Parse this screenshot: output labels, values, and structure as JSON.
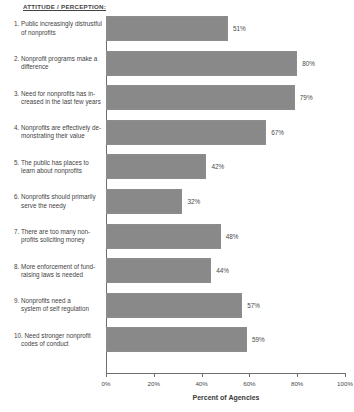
{
  "header": {
    "title": "ATTITUDE / PERCEPTION:"
  },
  "axis": {
    "x_title": "Percent of Agencies",
    "tick_labels": [
      "0%",
      "20%",
      "40%",
      "60%",
      "80%",
      "100%"
    ],
    "tick_values": [
      0,
      20,
      40,
      60,
      80,
      100
    ]
  },
  "categories": [
    {
      "number": "1.",
      "lines": [
        "1. Public increasingly distrustful",
        "of nonprofits"
      ],
      "value": 51,
      "value_label": "51%"
    },
    {
      "number": "2.",
      "lines": [
        "2. Nonprofit programs make a",
        "difference"
      ],
      "value": 80,
      "value_label": "80%"
    },
    {
      "number": "3.",
      "lines": [
        "3. Need for nonprofits has in-",
        "creased in the last few years"
      ],
      "value": 79,
      "value_label": "79%"
    },
    {
      "number": "4.",
      "lines": [
        "4. Nonprofits are effectively de-",
        "monstrating their  value"
      ],
      "value": 67,
      "value_label": "67%"
    },
    {
      "number": "5.",
      "lines": [
        "5. The public has places to",
        "learn about nonprofits"
      ],
      "value": 42,
      "value_label": "42%"
    },
    {
      "number": "6.",
      "lines": [
        "6. Nonprofits should primarily",
        "serve the needy"
      ],
      "value": 32,
      "value_label": "32%"
    },
    {
      "number": "7.",
      "lines": [
        "7. There are  too many non-",
        "profits soliciting money"
      ],
      "value": 48,
      "value_label": "48%"
    },
    {
      "number": "8.",
      "lines": [
        "8. More enforcement of fund-",
        "raising laws is needed"
      ],
      "value": 44,
      "value_label": "44%"
    },
    {
      "number": "9.",
      "lines": [
        "9. Nonprofits need a",
        "system of self regulation"
      ],
      "value": 57,
      "value_label": "57%"
    },
    {
      "number": "10.",
      "lines": [
        "10. Need stronger nonprofit",
        "codes of conduct"
      ],
      "value": 59,
      "value_label": "59%"
    }
  ],
  "chart_data": {
    "type": "bar",
    "orientation": "horizontal",
    "title": "ATTITUDE / PERCEPTION:",
    "xlabel": "Percent of Agencies",
    "ylabel": "",
    "xlim": [
      0,
      100
    ],
    "xticks": [
      0,
      20,
      40,
      60,
      80,
      100
    ],
    "xtick_labels": [
      "0%",
      "20%",
      "40%",
      "60%",
      "80%",
      "100%"
    ],
    "grid": false,
    "legend": false,
    "bar_color": "#898989",
    "categories": [
      "1. Public increasingly distrustful of nonprofits",
      "2. Nonprofit programs make a difference",
      "3. Need for nonprofits has increased in the last few years",
      "4. Nonprofits are effectively demonstrating their value",
      "5. The public has places to learn about nonprofits",
      "6. Nonprofits should primarily serve the needy",
      "7. There are too many nonprofits soliciting money",
      "8. More enforcement of fundraising laws is needed",
      "9. Nonprofits need a system of self regulation",
      "10. Need stronger nonprofit codes of conduct"
    ],
    "values": [
      51,
      80,
      79,
      67,
      42,
      32,
      48,
      44,
      57,
      59
    ],
    "data_labels": [
      "51%",
      "80%",
      "79%",
      "67%",
      "42%",
      "32%",
      "48%",
      "44%",
      "57%",
      "59%"
    ]
  }
}
